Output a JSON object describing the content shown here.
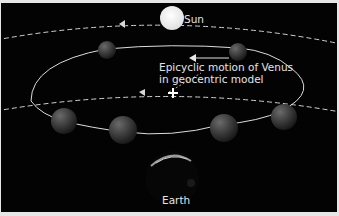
{
  "diagram": {
    "title": "Epicyclic motion of Venus in geocentric model",
    "labels": {
      "sun": "Sun",
      "earth": "Earth",
      "caption_line1": "Epicyclic motion of Venus",
      "caption_line2": "in geocentric model"
    },
    "elements": [
      {
        "name": "Sun",
        "shape": "white-circle",
        "orbit": "outer dashed circle"
      },
      {
        "name": "Earth",
        "shape": "dark-sphere",
        "position": "bottom center"
      },
      {
        "name": "Venus",
        "shape": "dark-sphere",
        "count": 6,
        "path": "epicycle loop"
      },
      {
        "name": "Epicycle center",
        "shape": "cross",
        "orbit": "inner dashed circle"
      }
    ],
    "colors": {
      "background": "#030303",
      "border": "#e6e6e6",
      "line": "#d8d8d8",
      "sun": "#f4f4f4",
      "text": "#e4e4e4"
    }
  }
}
